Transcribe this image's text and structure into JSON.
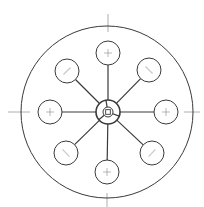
{
  "diagram": {
    "type": "radial-hub-and-spoke",
    "stroke_color": "#3a3a3a",
    "faint_color": "#9a9a9a",
    "background": "#ffffff",
    "outer_circle": {
      "cx": 107,
      "cy": 112,
      "r": 86
    },
    "hub": {
      "cx": 108,
      "cy": 112,
      "r": 12,
      "inner_r": 3.5,
      "divisions": 3
    },
    "satellites": [
      {
        "id": "n",
        "cx": 108,
        "cy": 53,
        "r": 12,
        "mark": "cross"
      },
      {
        "id": "ne",
        "cx": 149,
        "cy": 70,
        "r": 12,
        "mark": "diagonal"
      },
      {
        "id": "e",
        "cx": 166,
        "cy": 112,
        "r": 12,
        "mark": "cross"
      },
      {
        "id": "se",
        "cx": 152,
        "cy": 153,
        "r": 12,
        "mark": "diagonal"
      },
      {
        "id": "s",
        "cx": 107,
        "cy": 172,
        "r": 12,
        "mark": "cross"
      },
      {
        "id": "sw",
        "cx": 66,
        "cy": 153,
        "r": 12,
        "mark": "diagonal"
      },
      {
        "id": "w",
        "cx": 50,
        "cy": 112,
        "r": 12,
        "mark": "cross"
      },
      {
        "id": "nw",
        "cx": 67,
        "cy": 71,
        "r": 12,
        "mark": "diagonal"
      }
    ],
    "axis_ticks": [
      {
        "id": "top",
        "x1": 108,
        "y1": 14,
        "x2": 108,
        "y2": 32
      },
      {
        "id": "bottom",
        "x1": 107,
        "y1": 193,
        "x2": 107,
        "y2": 207
      },
      {
        "id": "left",
        "x1": 8,
        "y1": 112,
        "x2": 30,
        "y2": 112
      },
      {
        "id": "right",
        "x1": 184,
        "y1": 112,
        "x2": 200,
        "y2": 112
      }
    ]
  }
}
